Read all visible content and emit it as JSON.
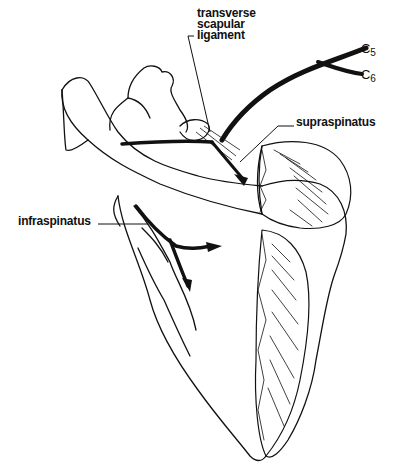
{
  "figure": {
    "labels": {
      "transverse_line1": "transverse",
      "transverse_line2": "scapular",
      "transverse_line3": "ligament",
      "supraspinatus": "supraspinatus",
      "infraspinatus": "infraspinatus",
      "c5_letter": "C",
      "c5_num": "5",
      "c6_letter": "C",
      "c6_num": "6"
    }
  }
}
